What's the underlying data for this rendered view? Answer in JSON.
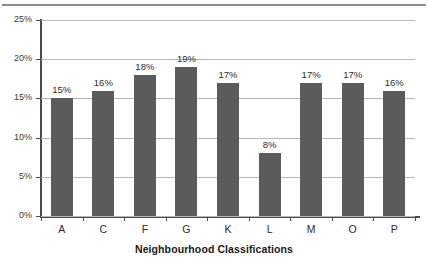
{
  "chart_data": {
    "type": "bar",
    "title": "",
    "subtitle": "",
    "xlabel": "Neighbourhood Classifications",
    "ylabel": "",
    "categories": [
      "A",
      "C",
      "F",
      "G",
      "K",
      "L",
      "M",
      "O",
      "P"
    ],
    "values": [
      15,
      16,
      18,
      19,
      17,
      8,
      17,
      17,
      16
    ],
    "data_labels": [
      "15%",
      "16%",
      "18%",
      "19%",
      "17%",
      "8%",
      "17%",
      "17%",
      "16%"
    ],
    "ylim": [
      0,
      25
    ],
    "ytick_values": [
      0,
      5,
      10,
      15,
      20,
      25
    ],
    "ytick_labels": [
      "0%",
      "5%",
      "10%",
      "15%",
      "20%",
      "25%"
    ],
    "grid": true,
    "grid_axis": "y",
    "legend": false,
    "legend_position": "none",
    "units": "percent",
    "series": [
      {
        "name": "Percentage",
        "values": [
          15,
          16,
          18,
          19,
          17,
          8,
          17,
          17,
          16
        ]
      }
    ]
  },
  "style": {
    "bar_color": "#5b5b5b",
    "gridline_color": "#b7b7b7",
    "axis_color": "#4a4a4a",
    "text_color": "#2b2b2b",
    "background_color": "#ffffff",
    "top_rule_color": "#8c8c8c"
  }
}
